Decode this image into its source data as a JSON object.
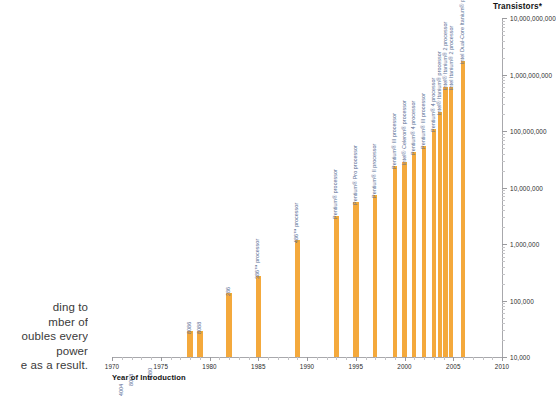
{
  "bodycopy": {
    "lines": [
      "ding to",
      "mber of",
      "oubles every",
      " power",
      "e as a result."
    ]
  },
  "chart_data": {
    "type": "bar",
    "title": "Transistors*",
    "xlabel": "Year of Introduction",
    "ylabel": "Transistors*",
    "yscale": "log",
    "ylim": [
      10000,
      10000000000
    ],
    "xlim": [
      1970,
      2010
    ],
    "grid": false,
    "legend": null,
    "ytick_labels": [
      "10,000,000,000",
      "1,000,000,000",
      "100,000,000",
      "10,000,000",
      "1,000,000",
      "100,000",
      "10,000"
    ],
    "ytick_values": [
      10000000000,
      1000000000,
      100000000,
      10000000,
      1000000,
      100000,
      10000
    ],
    "xtick_labels": [
      "1970",
      "1975",
      "1980",
      "1985",
      "1990",
      "1995",
      "2000",
      "2005",
      "2010"
    ],
    "xtick_values": [
      1970,
      1975,
      1980,
      1985,
      1990,
      1995,
      2000,
      2005,
      2010
    ],
    "bar_color": "#f4a93c",
    "label_color": "#5a6e96",
    "points": [
      {
        "label": "4004",
        "x": 1971,
        "y": 2300
      },
      {
        "label": "8008",
        "x": 1972,
        "y": 3500
      },
      {
        "label": "8080",
        "x": 1974,
        "y": 4500
      },
      {
        "label": "8086",
        "x": 1978,
        "y": 29000
      },
      {
        "label": "8088",
        "x": 1979,
        "y": 29000
      },
      {
        "label": "286",
        "x": 1982,
        "y": 134000
      },
      {
        "label": "386™ processor",
        "x": 1985,
        "y": 275000
      },
      {
        "label": "486™ processor",
        "x": 1989,
        "y": 1200000
      },
      {
        "label": "Pentium® processor",
        "x": 1993,
        "y": 3100000
      },
      {
        "label": "Pentium® Pro processor",
        "x": 1995,
        "y": 5500000
      },
      {
        "label": "Pentium® II processor",
        "x": 1997,
        "y": 7500000
      },
      {
        "label": "Pentium® III processor",
        "x": 1999,
        "y": 24000000
      },
      {
        "label": "Intel® Celeron® processor",
        "x": 2000,
        "y": 28000000
      },
      {
        "label": "Pentium® 4 processor",
        "x": 2001,
        "y": 42000000
      },
      {
        "label": "Pentium® III processor",
        "x": 2002,
        "y": 55000000
      },
      {
        "label": "Pentium® 4 processor",
        "x": 2003,
        "y": 110000000
      },
      {
        "label": "Intel® Itanium® processor",
        "x": 2003.6,
        "y": 220000000
      },
      {
        "label": "Intel® Itanium® 2 processor",
        "x": 2004.2,
        "y": 592000000
      },
      {
        "label": "Intel Itanium® 2 processor",
        "x": 2004.8,
        "y": 592000000
      },
      {
        "label": "Intel Dual-Core Itanium® processor",
        "x": 2006,
        "y": 1720000000
      }
    ]
  }
}
